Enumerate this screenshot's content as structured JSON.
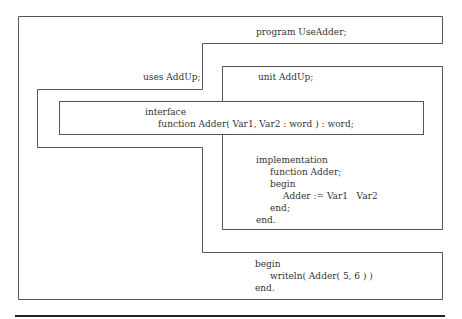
{
  "diagram": {
    "program_header": "program UseAdder;",
    "uses_clause": "uses AddUp;",
    "unit": {
      "header": "unit AddUp;",
      "interface": {
        "keyword": "interface",
        "declaration": "function Adder( Var1, Var2 : word ) : word;"
      },
      "implementation": {
        "lines": [
          "implementation",
          "function Adder;",
          "begin",
          "Adder := Var1   Var2",
          "end;",
          "end."
        ]
      }
    },
    "main_block": {
      "lines": [
        "begin",
        "writeln( Adder( 5, 6 ) )",
        "end."
      ]
    }
  }
}
